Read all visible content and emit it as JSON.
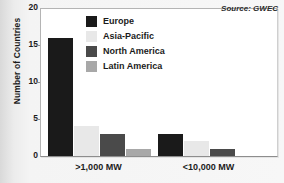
{
  "chart_data": {
    "type": "bar",
    "title": "",
    "subtitle": "",
    "xlabel": "",
    "ylabel": "Number of Countries",
    "categories": [
      ">1,000 MW",
      "<10,000 MW"
    ],
    "series": [
      {
        "name": "Europe",
        "color": "#1a1a1a",
        "values": [
          16,
          3
        ]
      },
      {
        "name": "Asia-Pacific",
        "color": "#e8e8e8",
        "values": [
          4,
          2
        ]
      },
      {
        "name": "North America",
        "color": "#4a4a4a",
        "values": [
          3,
          1
        ]
      },
      {
        "name": "Latin America",
        "color": "#a8a8a8",
        "values": [
          1,
          0
        ]
      }
    ],
    "ylim": [
      0,
      20
    ],
    "yticks": [
      0,
      5,
      10,
      15,
      20
    ],
    "ytick_labels": [
      "0",
      "5",
      "10",
      "15",
      "20"
    ],
    "grid": false,
    "legend_position": "top-center",
    "annotations": [
      {
        "name": "source-note",
        "text": "Source: GWEC"
      }
    ]
  },
  "source_note": "Source: GWEC"
}
